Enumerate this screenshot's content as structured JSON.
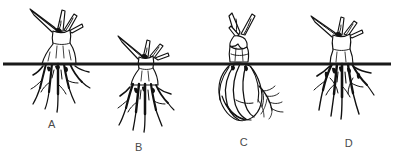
{
  "figure": {
    "background_color": "#ffffff",
    "ink_color": "#111111",
    "label_color": "#4a4a4a",
    "width": 400,
    "height": 165,
    "clipped_header_text": "",
    "soil_line": {
      "name": "soil-line",
      "color": "#1a1a1a",
      "y": 64,
      "x_start": 3,
      "x_end": 391,
      "thickness": 3.2
    },
    "specimens": [
      {
        "id": "A",
        "label": "A",
        "label_x": 52,
        "label_y": 125,
        "crown_position": "above-soil-line",
        "description": "trimmed crown with upright leaf blades held well above the soil line; flaring stem base and spreading fibrous roots below"
      },
      {
        "id": "B",
        "label": "B",
        "label_x": 139,
        "label_y": 148,
        "crown_position": "at-soil-line",
        "description": "crown set down at the soil line so the stem base is buried; long fibrous roots hanging below"
      },
      {
        "id": "C",
        "label": "C",
        "label_x": 244,
        "label_y": 143,
        "crown_position": "above-soil-line",
        "description": "bulbous swollen base beneath the soil line wrapped in sheathing strands, with a fine branching root at the right side"
      },
      {
        "id": "D",
        "label": "D",
        "label_x": 349,
        "label_y": 144,
        "crown_position": "above-soil-line",
        "description": "narrow cut crown above the line over a dense mass of thick downward fibrous roots"
      }
    ]
  }
}
